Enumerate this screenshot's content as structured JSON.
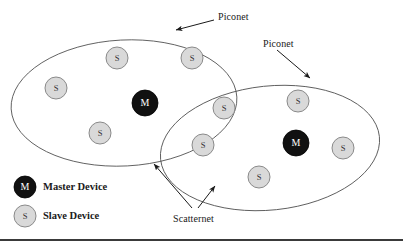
{
  "figure": {
    "colors": {
      "master_fill": "#111111",
      "master_stroke": "#000000",
      "master_text": "#ffffff",
      "slave_fill": "#d9d9d9",
      "slave_stroke": "#8a8a8a",
      "slave_text": "#333333",
      "ellipse_stroke": "#555555",
      "arrow_color": "#1a1a1a",
      "rule_color": "#3a3a3a",
      "background": "#ffffff"
    },
    "annotations": [
      {
        "name": "piconet-label-left",
        "text": "Piconet",
        "x": 218,
        "y": 11,
        "arrow": {
          "x1": 214,
          "y1": 20,
          "x2": 176,
          "y2": 30
        }
      },
      {
        "name": "piconet-label-right",
        "text": "Piconet",
        "x": 263,
        "y": 38,
        "arrow": {
          "x1": 277,
          "y1": 50,
          "x2": 310,
          "y2": 78
        }
      },
      {
        "name": "scatternet-label",
        "text": "Scatternet",
        "x": 173,
        "y": 213,
        "arrows": [
          {
            "x1": 192,
            "y1": 208,
            "x2": 154,
            "y2": 164
          },
          {
            "x1": 198,
            "y1": 208,
            "x2": 215,
            "y2": 186
          }
        ]
      }
    ],
    "piconets": [
      {
        "name": "piconet-left",
        "ellipse": {
          "cx": 124,
          "cy": 103,
          "rx": 113,
          "ry": 63,
          "rotate": -3
        },
        "nodes": [
          {
            "type": "master",
            "letter": "M",
            "x": 145,
            "y": 103,
            "r": 13
          },
          {
            "type": "slave",
            "letter": "S",
            "x": 56,
            "y": 88,
            "r": 11
          },
          {
            "type": "slave",
            "letter": "S",
            "x": 117,
            "y": 58,
            "r": 11
          },
          {
            "type": "slave",
            "letter": "S",
            "x": 192,
            "y": 58,
            "r": 11
          },
          {
            "type": "slave",
            "letter": "S",
            "x": 100,
            "y": 133,
            "r": 11
          }
        ]
      },
      {
        "name": "piconet-right",
        "ellipse": {
          "cx": 270,
          "cy": 148,
          "rx": 110,
          "ry": 62,
          "rotate": -6
        },
        "nodes": [
          {
            "type": "master",
            "letter": "M",
            "x": 296,
            "y": 143,
            "r": 13
          },
          {
            "type": "slave",
            "letter": "S",
            "x": 224,
            "y": 108,
            "r": 11
          },
          {
            "type": "slave",
            "letter": "S",
            "x": 203,
            "y": 145,
            "r": 11
          },
          {
            "type": "slave",
            "letter": "S",
            "x": 298,
            "y": 101,
            "r": 11
          },
          {
            "type": "slave",
            "letter": "S",
            "x": 343,
            "y": 148,
            "r": 11
          },
          {
            "type": "slave",
            "letter": "S",
            "x": 259,
            "y": 177,
            "r": 11
          }
        ]
      }
    ],
    "legend": {
      "name": "legend",
      "items": [
        {
          "name": "legend-master",
          "type": "master",
          "letter": "M",
          "label": "Master Device",
          "cx": 25,
          "cy": 187,
          "r": 11,
          "label_x": 43,
          "label_y": 181
        },
        {
          "name": "legend-slave",
          "type": "slave",
          "letter": "S",
          "label": "Slave Device",
          "cx": 25,
          "cy": 216,
          "r": 11,
          "label_x": 43,
          "label_y": 210
        }
      ]
    },
    "bottom_rule": {
      "y": 240,
      "x1": 0,
      "x2": 403,
      "thickness": 2
    }
  }
}
